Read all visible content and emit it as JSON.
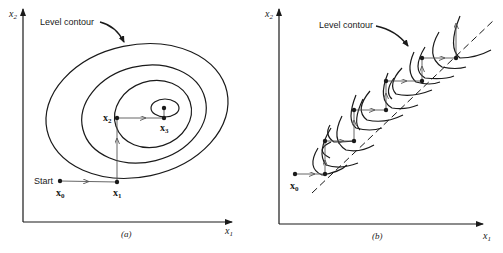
{
  "panel_a": {
    "caption": "(a)",
    "x_axis_label": "x",
    "x_axis_sub": "1",
    "y_axis_label": "x",
    "y_axis_sub": "2",
    "contour_label": "Level contour",
    "start_label": "Start",
    "points": [
      {
        "name": "x",
        "sub": "0"
      },
      {
        "name": "x",
        "sub": "1"
      },
      {
        "name": "x",
        "sub": "2"
      },
      {
        "name": "x",
        "sub": "3"
      }
    ]
  },
  "panel_b": {
    "caption": "(b)",
    "x_axis_label": "x",
    "x_axis_sub": "1",
    "y_axis_label": "x",
    "y_axis_sub": "2",
    "contour_label": "Level contour",
    "start_point": {
      "name": "x",
      "sub": "0"
    }
  },
  "colors": {
    "ink": "#1a1a1a",
    "arrow": "#555555",
    "background": "#ffffff"
  }
}
